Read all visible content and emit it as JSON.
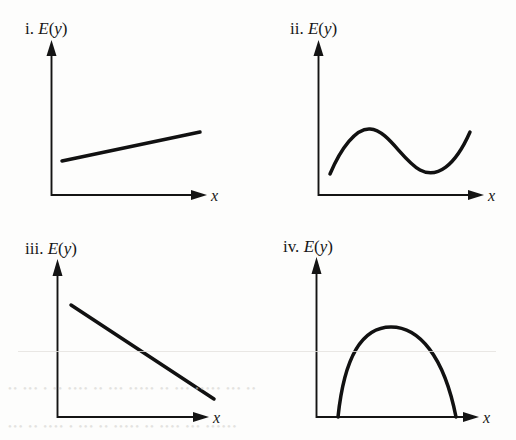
{
  "figure": {
    "background_color": "#fdfdfc",
    "ink_color": "#111111",
    "width": 516,
    "height": 440,
    "panel_count": 4
  },
  "panels": [
    {
      "id": "panel-i",
      "enumerator": "i.",
      "y_axis_label": "E(y)",
      "y_axis_label_parts": {
        "fn": "E",
        "open": "(",
        "var": "y",
        "close": ")"
      },
      "x_axis_label": "x",
      "relationship": "linear-increasing"
    },
    {
      "id": "panel-ii",
      "enumerator": "ii.",
      "y_axis_label": "E(y)",
      "y_axis_label_parts": {
        "fn": "E",
        "open": "(",
        "var": "y",
        "close": ")"
      },
      "x_axis_label": "x",
      "relationship": "cubic"
    },
    {
      "id": "panel-iii",
      "enumerator": "iii.",
      "y_axis_label": "E(y)",
      "y_axis_label_parts": {
        "fn": "E",
        "open": "(",
        "var": "y",
        "close": ")"
      },
      "x_axis_label": "x",
      "relationship": "linear-decreasing"
    },
    {
      "id": "panel-iv",
      "enumerator": "iv.",
      "y_axis_label": "E(y)",
      "y_axis_label_parts": {
        "fn": "E",
        "open": "(",
        "var": "y",
        "close": ")"
      },
      "x_axis_label": "x",
      "relationship": "quadratic-concave-down"
    }
  ],
  "chart_data": [
    {
      "type": "line",
      "id": "panel-i",
      "title": "i. E(y)",
      "xlabel": "x",
      "ylabel": "E(y)",
      "relationship": "linear increasing",
      "grid": false,
      "legend": "none",
      "axis_ticks": [],
      "xlim": [
        0,
        1
      ],
      "ylim": [
        0,
        1
      ],
      "x": [
        0.07,
        1.0
      ],
      "y": [
        0.22,
        0.42
      ],
      "path": "M 62 161 L 200 132",
      "note": "straight line with small positive slope, drawn over middle of panel"
    },
    {
      "type": "line",
      "id": "panel-ii",
      "title": "ii. E(y)",
      "xlabel": "x",
      "ylabel": "E(y)",
      "relationship": "cubic (rise, fall, rise)",
      "grid": false,
      "legend": "none",
      "axis_ticks": [],
      "xlim": [
        0,
        1
      ],
      "ylim": [
        0,
        1
      ],
      "x": [
        0.08,
        0.33,
        0.62,
        0.8,
        1.0
      ],
      "y": [
        0.15,
        0.44,
        0.17,
        0.15,
        0.42
      ],
      "path": "M 330 174 C 341 148, 356 128, 370 129 C 388 130, 402 160, 420 170 C 437 179, 455 166, 470 132",
      "note": "local maximum near x=0.33, local minimum near x=0.78"
    },
    {
      "type": "line",
      "id": "panel-iii",
      "title": "iii. E(y)",
      "xlabel": "x",
      "ylabel": "E(y)",
      "relationship": "linear decreasing",
      "grid": false,
      "legend": "none",
      "axis_ticks": [],
      "xlim": [
        0,
        1
      ],
      "ylim": [
        0,
        1
      ],
      "x": [
        0.09,
        1.0
      ],
      "y": [
        0.72,
        0.12
      ],
      "path": "M 71 305 L 214 399",
      "note": "straight line with pronounced negative slope"
    },
    {
      "type": "line",
      "id": "panel-iv",
      "title": "iv. E(y)",
      "xlabel": "x",
      "ylabel": "E(y)",
      "relationship": "quadratic, concave down",
      "grid": false,
      "legend": "none",
      "axis_ticks": [],
      "xlim": [
        0,
        1
      ],
      "ylim": [
        0,
        1
      ],
      "x": [
        0.15,
        0.53,
        0.99
      ],
      "y": [
        0.0,
        0.57,
        0.0
      ],
      "path": "M 338 417 C 345 350, 365 327, 391 327 C 419 327, 444 356, 456 417",
      "note": "inverted parabola meeting the x-axis at both ends"
    }
  ]
}
